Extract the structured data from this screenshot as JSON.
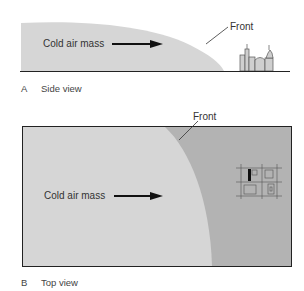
{
  "panel_a": {
    "caption_letter": "A",
    "caption_text": "Side view",
    "air_mass_label": "Cold air mass",
    "front_label": "Front"
  },
  "panel_b": {
    "caption_letter": "B",
    "caption_text": "Top view",
    "air_mass_label": "Cold air mass",
    "front_label": "Front"
  },
  "colors": {
    "cold_air": "#d6d6d6",
    "warm_region": "#b3b3b3",
    "outline": "#222222",
    "arrow": "#111111"
  }
}
